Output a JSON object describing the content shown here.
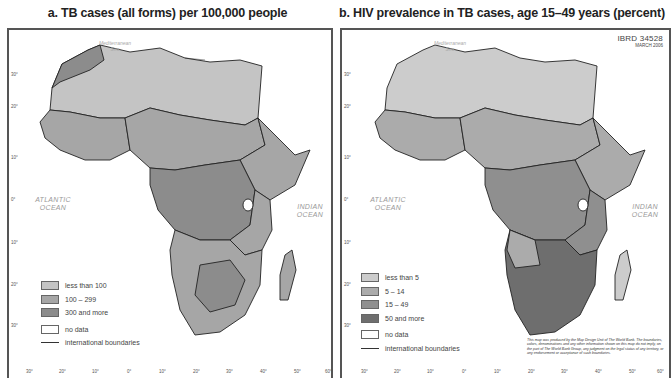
{
  "maps": [
    {
      "id": "a",
      "title": "a. TB cases (all forms) per 100,000 people",
      "legend": [
        {
          "label": "less than 100",
          "color": "#c4c4c4"
        },
        {
          "label": "100 – 299",
          "color": "#a6a6a6"
        },
        {
          "label": "300 and more",
          "color": "#8c8c8c"
        },
        {
          "label": "no data",
          "color": "#ffffff"
        }
      ],
      "boundary_label": "international boundaries"
    },
    {
      "id": "b",
      "title": "b. HIV prevalence in TB cases, age 15–49 years (percent)",
      "legend": [
        {
          "label": "less than 5",
          "color": "#cccccc"
        },
        {
          "label": "5 – 14",
          "color": "#ababab"
        },
        {
          "label": "15 – 49",
          "color": "#8f8f8f"
        },
        {
          "label": "50 and more",
          "color": "#6e6e6e"
        },
        {
          "label": "no data",
          "color": "#ffffff"
        }
      ],
      "boundary_label": "international boundaries",
      "ibrd_id": "IBRD 34528",
      "date": "MARCH 2006",
      "disclaimer": "This map was produced by the Map Design Unit of The World Bank. The boundaries, colors, denominations and any other information shown on this map do not imply, on the part of The World Bank Group, any judgment on the legal status of any territory, or any endorsement or acceptance of such boundaries."
    }
  ],
  "labels": {
    "atlantic": "ATLANTIC OCEAN",
    "atlantic_l1": "ATLANTIC",
    "atlantic_l2": "OCEAN",
    "indian_l1": "INDIAN",
    "indian_l2": "OCEAN",
    "med_l1": "Mediterranean",
    "med_l2": "Sea"
  },
  "longitude_ticks": [
    "30°",
    "20°",
    "10°",
    "0°",
    "10°",
    "20°",
    "30°",
    "40°",
    "50°",
    "60°"
  ],
  "latitude_ticks": [
    "30°",
    "20°",
    "10°",
    "0°",
    "10°",
    "20°",
    "30°"
  ]
}
